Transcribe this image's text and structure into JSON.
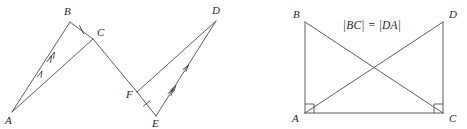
{
  "figure": {
    "background_color": "#ffffff",
    "line_color": "#4a4a52",
    "label_color": "#262626",
    "width": 467,
    "height": 129
  },
  "left_diagram": {
    "name": "zigzag-congruent-triangles",
    "vertices": [
      {
        "id": "A",
        "label": "A",
        "x": 12,
        "y": 112,
        "label_x": 5,
        "label_y": 124
      },
      {
        "id": "B",
        "label": "B",
        "x": 70,
        "y": 22,
        "label_x": 64,
        "label_y": 15
      },
      {
        "id": "C",
        "label": "C",
        "x": 93,
        "y": 39,
        "label_x": 97,
        "label_y": 36
      },
      {
        "id": "F",
        "label": "F",
        "x": 137,
        "y": 92,
        "label_x": 128,
        "label_y": 98
      },
      {
        "id": "E",
        "label": "E",
        "x": 156,
        "y": 116,
        "label_x": 152,
        "label_y": 127
      },
      {
        "id": "D",
        "label": "D",
        "x": 216,
        "y": 21,
        "label_x": 212,
        "label_y": 14
      }
    ],
    "segments": [
      {
        "id": "AB",
        "from": "A",
        "to": "B",
        "ticks": 0
      },
      {
        "id": "BC",
        "from": "B",
        "to": "C",
        "ticks": 1
      },
      {
        "id": "CA",
        "from": "C",
        "to": "A",
        "ticks": 0
      },
      {
        "id": "CF",
        "from": "C",
        "to": "F",
        "ticks": 0
      },
      {
        "id": "FD",
        "from": "F",
        "to": "D",
        "ticks": 0
      },
      {
        "id": "DE",
        "from": "D",
        "to": "E",
        "ticks": 0
      },
      {
        "id": "EF",
        "from": "E",
        "to": "F",
        "ticks": 1
      }
    ],
    "chevrons": [
      {
        "on": "AB",
        "count": 1,
        "position": 0.52,
        "note": "single arrow on A-B"
      },
      {
        "on": "AB",
        "count": 2,
        "position": 0.7,
        "note": "double arrow on A-B"
      },
      {
        "on": "DE",
        "count": 1,
        "position": 0.48,
        "note": "single arrow on D-E"
      },
      {
        "on": "DE",
        "count": 2,
        "position": 0.28,
        "note": "double arrow on D-E"
      }
    ]
  },
  "right_diagram": {
    "name": "rectangle-with-diagonals",
    "equation": "|BC| = |DA|",
    "equation_x": 372,
    "equation_y": 29,
    "vertices": [
      {
        "id": "B",
        "label": "B",
        "x": 305,
        "y": 22,
        "label_x": 293,
        "label_y": 18
      },
      {
        "id": "D",
        "label": "D",
        "x": 443,
        "y": 22,
        "label_x": 449,
        "label_y": 18
      },
      {
        "id": "A",
        "label": "A",
        "x": 305,
        "y": 113,
        "label_x": 292,
        "label_y": 122
      },
      {
        "id": "C",
        "label": "C",
        "x": 443,
        "y": 113,
        "label_x": 449,
        "label_y": 122
      }
    ],
    "segments": [
      {
        "id": "BA",
        "from": "B",
        "to": "A"
      },
      {
        "id": "AC",
        "from": "A",
        "to": "C"
      },
      {
        "id": "CD",
        "from": "C",
        "to": "D"
      },
      {
        "id": "BC-diagonal",
        "from": "B",
        "to": "C"
      },
      {
        "id": "DA-diagonal",
        "from": "D",
        "to": "A"
      }
    ],
    "right_angles": [
      {
        "at": "A",
        "x": 305,
        "y": 113,
        "size": 9,
        "dir_x": 1,
        "dir_y": -1
      },
      {
        "at": "C",
        "x": 443,
        "y": 113,
        "size": 9,
        "dir_x": -1,
        "dir_y": -1
      }
    ]
  }
}
